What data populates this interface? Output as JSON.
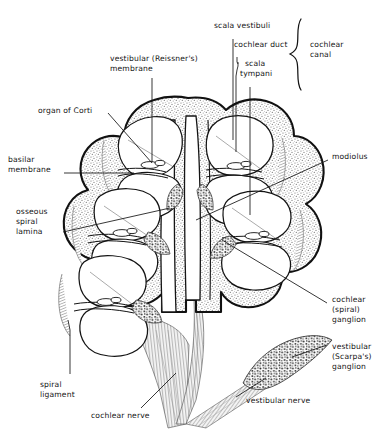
{
  "figure": {
    "background_color": "#ffffff",
    "ink_color": "#141414",
    "bone_stipple_color": "#6b6b6b",
    "ganglion_stipple_color": "#2b2b2b",
    "nerve_fiber_color": "#9a9a9a"
  },
  "labels": {
    "scala_vestibuli": "scala vestibuli",
    "cochlear_duct": "cochlear duct",
    "scala_tympani_l1": "scala",
    "scala_tympani_l2": "tympani",
    "cochlear_canal_l1": "cochlear",
    "cochlear_canal_l2": "canal",
    "vestibular_membrane_l1": "vestibular (Reissner's)",
    "vestibular_membrane_l2": "membrane",
    "organ_of_corti": "organ of Corti",
    "basilar_membrane_l1": "basilar",
    "basilar_membrane_l2": "membrane",
    "osseous_spiral_lamina_l1": "osseous",
    "osseous_spiral_lamina_l2": "spiral",
    "osseous_spiral_lamina_l3": "lamina",
    "spiral_ligament_l1": "spiral",
    "spiral_ligament_l2": "ligament",
    "modiolus": "modiolus",
    "cochlear_ganglion_l1": "cochlear",
    "cochlear_ganglion_l2": "(spiral)",
    "cochlear_ganglion_l3": "ganglion",
    "vestibular_ganglion_l1": "vestibular",
    "vestibular_ganglion_l2": "(Scarpa's)",
    "vestibular_ganglion_l3": "ganglion",
    "cochlear_nerve": "cochlear nerve",
    "vestibular_nerve": "vestibular nerve"
  }
}
